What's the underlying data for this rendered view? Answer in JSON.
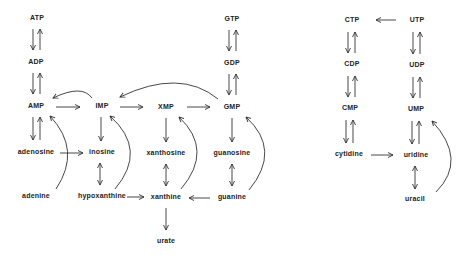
{
  "diagram": {
    "type": "nucleotide metabolism pathway",
    "purine": {
      "nodes": {
        "atp": "ATP",
        "adp": "ADP",
        "amp": "AMP",
        "imp": "IMP",
        "xmp": "XMP",
        "gmp": "GMP",
        "gdp": "GDP",
        "gtp": "GTP",
        "adenosine": "adenosine",
        "inosine": "inosine",
        "xanthosine": "xanthosine",
        "guanosine": "guanosine",
        "adenine": "adenine",
        "hypoxanthine": "hypoxanthine",
        "xanthine": "xanthine",
        "guanine": "guanine",
        "urate": "urate"
      },
      "edges": [
        {
          "from": "ATP",
          "to": "ADP",
          "type": "reversible"
        },
        {
          "from": "ADP",
          "to": "AMP",
          "type": "reversible"
        },
        {
          "from": "GTP",
          "to": "GDP",
          "type": "reversible"
        },
        {
          "from": "GDP",
          "to": "GMP",
          "type": "reversible"
        },
        {
          "from": "AMP",
          "to": "adenosine",
          "type": "reversible"
        },
        {
          "from": "AMP",
          "to": "IMP",
          "type": "forward"
        },
        {
          "from": "IMP",
          "to": "AMP",
          "type": "curved"
        },
        {
          "from": "IMP",
          "to": "XMP",
          "type": "forward"
        },
        {
          "from": "XMP",
          "to": "GMP",
          "type": "forward"
        },
        {
          "from": "GMP",
          "to": "IMP",
          "type": "curved"
        },
        {
          "from": "IMP",
          "to": "inosine",
          "type": "forward"
        },
        {
          "from": "XMP",
          "to": "xanthosine",
          "type": "forward"
        },
        {
          "from": "GMP",
          "to": "guanosine",
          "type": "forward"
        },
        {
          "from": "adenosine",
          "to": "inosine",
          "type": "forward"
        },
        {
          "from": "inosine",
          "to": "hypoxanthine",
          "type": "double-headed"
        },
        {
          "from": "xanthosine",
          "to": "xanthine",
          "type": "double-headed"
        },
        {
          "from": "guanosine",
          "to": "guanine",
          "type": "double-headed"
        },
        {
          "from": "hypoxanthine",
          "to": "xanthine",
          "type": "forward"
        },
        {
          "from": "guanine",
          "to": "xanthine",
          "type": "forward"
        },
        {
          "from": "xanthine",
          "to": "urate",
          "type": "forward"
        },
        {
          "from": "adenine",
          "to": "AMP",
          "type": "curved"
        },
        {
          "from": "hypoxanthine",
          "to": "IMP",
          "type": "curved"
        },
        {
          "from": "xanthine",
          "to": "XMP",
          "type": "curved"
        },
        {
          "from": "guanine",
          "to": "GMP",
          "type": "curved"
        }
      ]
    },
    "pyrimidine": {
      "nodes": {
        "ctp": "CTP",
        "cdp": "CDP",
        "cmp": "CMP",
        "utp": "UTP",
        "udp": "UDP",
        "ump": "UMP",
        "cytidine": "cytidine",
        "uridine": "uridine",
        "uracil": "uracil"
      },
      "edges": [
        {
          "from": "UTP",
          "to": "CTP",
          "type": "forward"
        },
        {
          "from": "CTP",
          "to": "CDP",
          "type": "reversible"
        },
        {
          "from": "CDP",
          "to": "CMP",
          "type": "reversible"
        },
        {
          "from": "CMP",
          "to": "cytidine",
          "type": "reversible"
        },
        {
          "from": "UTP",
          "to": "UDP",
          "type": "reversible"
        },
        {
          "from": "UDP",
          "to": "UMP",
          "type": "reversible"
        },
        {
          "from": "UMP",
          "to": "uridine",
          "type": "reversible"
        },
        {
          "from": "cytidine",
          "to": "uridine",
          "type": "forward"
        },
        {
          "from": "uridine",
          "to": "uracil",
          "type": "double-headed"
        },
        {
          "from": "uracil",
          "to": "UMP",
          "type": "curved"
        }
      ]
    }
  }
}
